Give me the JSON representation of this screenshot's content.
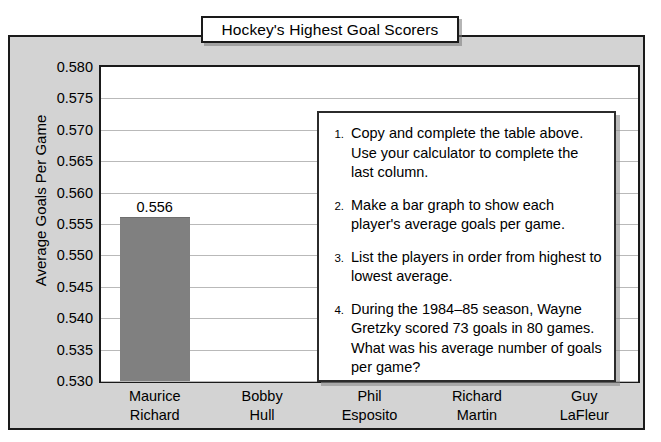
{
  "title": "Hockey's Highest Goal Scorers",
  "axis": {
    "y_title": "Average Goals Per Game",
    "ticks": [
      "0.580",
      "0.575",
      "0.570",
      "0.565",
      "0.560",
      "0.555",
      "0.550",
      "0.545",
      "0.540",
      "0.535",
      "0.530"
    ]
  },
  "instructions": [
    {
      "num": "1.",
      "text": "Copy and complete the table above. Use your calculator to complete the last column."
    },
    {
      "num": "2.",
      "text": "Make a bar graph to show each player's average goals per game."
    },
    {
      "num": "3.",
      "text": "List the players in order from highest to lowest average."
    },
    {
      "num": "4.",
      "text": "During the 1984–85 season, Wayne Gretzky scored 73 goals in 80 games. What was his average number of goals per game?"
    }
  ],
  "players": [
    {
      "line1": "Maurice",
      "line2": "Richard",
      "value_label": "0.556"
    },
    {
      "line1": "Bobby",
      "line2": "Hull",
      "value_label": ""
    },
    {
      "line1": "Phil",
      "line2": "Esposito",
      "value_label": ""
    },
    {
      "line1": "Richard",
      "line2": "Martin",
      "value_label": ""
    },
    {
      "line1": "Guy",
      "line2": "LaFleur",
      "value_label": ""
    }
  ],
  "colors": {
    "bar": "#808080",
    "panel": "#d3d3d3",
    "plot": "#ffffff",
    "grid": "#b9b9b9",
    "outline": "#1a1a1a"
  },
  "chart_data": {
    "type": "bar",
    "title": "Hockey's Highest Goal Scorers",
    "xlabel": "",
    "ylabel": "Average Goals Per Game",
    "categories": [
      "Maurice Richard",
      "Bobby Hull",
      "Phil Esposito",
      "Richard Martin",
      "Guy LaFleur"
    ],
    "values": [
      0.556,
      null,
      null,
      null,
      null
    ],
    "data_labels": [
      "0.556",
      "",
      "",
      "",
      ""
    ],
    "ylim": [
      0.53,
      0.58
    ],
    "ytick_step": 0.005,
    "yticks": [
      0.53,
      0.535,
      0.54,
      0.545,
      0.55,
      0.555,
      0.56,
      0.565,
      0.57,
      0.575,
      0.58
    ],
    "grid": true,
    "legend": "none",
    "note": "Only the first bar (Maurice Richard) is drawn; remaining categories are blank for the student to complete."
  }
}
